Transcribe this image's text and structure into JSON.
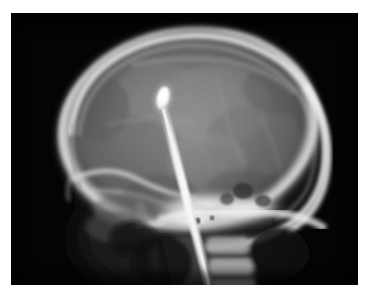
{
  "image": {
    "kind": "radiograph",
    "modality": "X-ray",
    "view": "lateral skull",
    "title": "Lateral skull radiograph showing penetrating metallic foreign body",
    "background_color": "#ffffff",
    "film_color": "#030303",
    "film_rect": {
      "x": 11,
      "y": 13,
      "width": 347,
      "height": 272
    }
  },
  "anatomy": {
    "cranial_vault": {
      "label": "cranial vault",
      "center": {
        "x": 190,
        "y": 130
      },
      "radius_x": 132,
      "radius_y": 103,
      "rotation_deg": -8,
      "fill_color": "#5a5a5a",
      "cortex_color": "#d8d8d8"
    },
    "frontal_bone": {
      "label": "frontal bone",
      "x": 78,
      "y": 120
    },
    "occipital_bone": {
      "label": "occipital bone",
      "x": 300,
      "y": 150
    },
    "skull_base": {
      "label": "skull base / petrous temporal bone",
      "x": 200,
      "y": 208,
      "color": "#f2f2f2"
    },
    "facial_bones": {
      "label": "facial bones / orbit",
      "x": 95,
      "y": 178
    },
    "cervical_spine": {
      "label": "cervical spine",
      "x": 215,
      "y": 258,
      "vertebrae_count": 3
    },
    "mandible_ramus": {
      "label": "mandibular ramus",
      "x": 140,
      "y": 235
    },
    "sella_turcica": {
      "label": "sella region",
      "x": 186,
      "y": 212
    }
  },
  "foreign_body": {
    "label": "penetrating metallic rod",
    "description": "radiopaque rod with bulbous tip within cranial cavity",
    "tip": {
      "x": 163,
      "y": 96
    },
    "tip_width": 10,
    "tip_height": 20,
    "entry_visible": {
      "x": 206,
      "y": 285
    },
    "shaft_width": 6,
    "color": "#ffffff",
    "angle_deg": 13
  },
  "annotations": {
    "visible_text": []
  }
}
